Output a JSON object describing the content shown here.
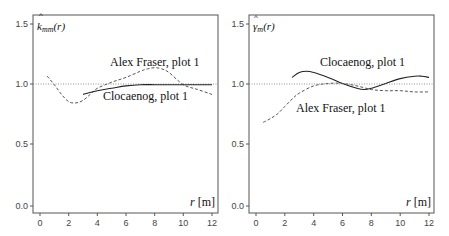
{
  "chart_data": [
    {
      "type": "line",
      "title": "",
      "ylabel": "k̂_mm(r)",
      "xlabel": "r [m]",
      "xlim": [
        -0.5,
        12.5
      ],
      "ylim": [
        -0.05,
        1.55
      ],
      "xticks": [
        0,
        2,
        4,
        6,
        8,
        10,
        12
      ],
      "yticks": [
        "0.0",
        "0.5",
        "1.0",
        "1.5"
      ],
      "reference_line": 1.0,
      "series": [
        {
          "name": "Alex Fraser, plot 1",
          "style": "dashed",
          "x": [
            0.5,
            1,
            1.5,
            2,
            2.5,
            3,
            3.5,
            4,
            5,
            6,
            7,
            7.5,
            8,
            8.5,
            9,
            10,
            11,
            12
          ],
          "y": [
            1.07,
            1.0,
            0.92,
            0.86,
            0.85,
            0.87,
            0.92,
            0.97,
            1.02,
            1.06,
            1.11,
            1.13,
            1.14,
            1.13,
            1.1,
            1.0,
            0.96,
            0.92
          ]
        },
        {
          "name": "Clocaenog, plot 1",
          "style": "solid",
          "x": [
            3,
            4,
            5,
            6,
            7,
            8,
            9,
            10,
            11,
            12
          ],
          "y": [
            0.92,
            0.95,
            0.97,
            0.99,
            1.0,
            1.0,
            1.0,
            1.0,
            1.0,
            1.0
          ]
        }
      ],
      "annotations": [
        "Alex Fraser, plot 1",
        "Clocaenog, plot 1"
      ]
    },
    {
      "type": "line",
      "title": "",
      "ylabel": "γ̂_m(r)",
      "xlabel": "r [m]",
      "xlim": [
        -0.5,
        12.5
      ],
      "ylim": [
        -0.05,
        1.55
      ],
      "xticks": [
        0,
        2,
        4,
        6,
        8,
        10,
        12
      ],
      "yticks": [
        "0.0",
        "0.5",
        "1.0",
        "1.5"
      ],
      "reference_line": 1.0,
      "series": [
        {
          "name": "Clocaenog, plot 1",
          "style": "solid",
          "x": [
            2.5,
            3,
            3.5,
            4,
            5,
            6,
            7,
            7.5,
            8,
            9,
            10,
            11,
            11.5,
            12
          ],
          "y": [
            1.06,
            1.1,
            1.11,
            1.1,
            1.06,
            1.01,
            0.97,
            0.96,
            0.97,
            1.01,
            1.05,
            1.07,
            1.07,
            1.06
          ]
        },
        {
          "name": "Alex Fraser, plot 1",
          "style": "dashed",
          "x": [
            0.5,
            1,
            1.5,
            2,
            2.5,
            3,
            4,
            5,
            6,
            7,
            8,
            9,
            10,
            11,
            12
          ],
          "y": [
            0.69,
            0.72,
            0.76,
            0.82,
            0.88,
            0.93,
            0.99,
            1.01,
            1.01,
            0.99,
            0.96,
            0.95,
            0.95,
            0.94,
            0.94
          ]
        }
      ],
      "annotations": [
        "Clocaenog, plot 1",
        "Alex Fraser, plot 1"
      ]
    }
  ],
  "panels": [
    {
      "ylabel_main": "k",
      "ylabel_sub": "mm",
      "ylabel_tail": "(r)",
      "label_top": "Alex Fraser, plot 1",
      "label_bottom": "Clocaenog, plot 1",
      "xunit": "[m]",
      "xvar": "r"
    },
    {
      "ylabel_main": "γ",
      "ylabel_sub": "m",
      "ylabel_tail": "(r)",
      "label_top": "Clocaenog, plot 1",
      "label_bottom": "Alex Fraser, plot 1",
      "xunit": "[m]",
      "xvar": "r"
    }
  ],
  "ticks": {
    "x": [
      "0",
      "2",
      "4",
      "6",
      "8",
      "10",
      "12"
    ],
    "y": [
      "0.0",
      "0.5",
      "1.0",
      "1.5"
    ]
  }
}
